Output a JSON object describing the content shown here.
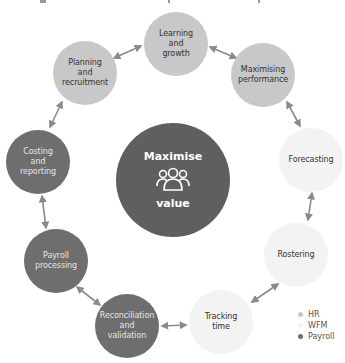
{
  "diagram": {
    "center": {
      "title": "Maximise",
      "subtitle": "value",
      "icon": "people-group-icon",
      "color": "#5f5f5f"
    },
    "nodes": [
      {
        "id": "learning",
        "label": "Learning\nand\ngrowth",
        "category": "HR",
        "x": 176,
        "y": 44
      },
      {
        "id": "maximising",
        "label": "Maximising\nperformance",
        "category": "HR",
        "x": 263,
        "y": 75
      },
      {
        "id": "forecasting",
        "label": "Forecasting",
        "category": "WFM",
        "x": 311,
        "y": 160
      },
      {
        "id": "rostering",
        "label": "Rostering",
        "category": "WFM",
        "x": 296,
        "y": 255
      },
      {
        "id": "tracking",
        "label": "Tracking\ntime",
        "category": "WFM",
        "x": 221,
        "y": 322
      },
      {
        "id": "reconciliation",
        "label": "Reconciliation\nand\nvalidation",
        "category": "Payroll",
        "x": 127,
        "y": 326
      },
      {
        "id": "payroll-processing",
        "label": "Payroll\nprocessing",
        "category": "Payroll",
        "x": 56,
        "y": 261
      },
      {
        "id": "costing",
        "label": "Costing\nand\nreporting",
        "category": "Payroll",
        "x": 38,
        "y": 162
      },
      {
        "id": "planning",
        "label": "Planning\nand\nrecruitment",
        "category": "HR",
        "x": 85,
        "y": 73
      }
    ],
    "connections": "bidirectional arrows between consecutive nodes in a cycle"
  },
  "legend": [
    {
      "label": "HR",
      "color": "#c8c8c8"
    },
    {
      "label": "WFM",
      "color": "#f3f3f3"
    },
    {
      "label": "Payroll",
      "color": "#6e6e6e"
    }
  ]
}
